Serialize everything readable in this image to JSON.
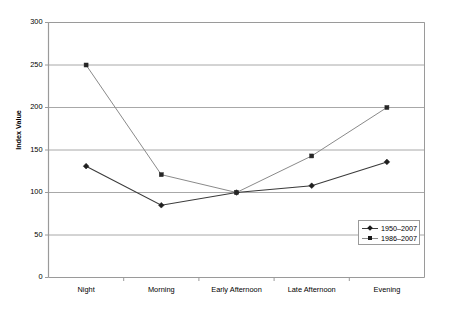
{
  "chart_data": {
    "type": "line",
    "title": "",
    "subtitle": "",
    "xlabel": "",
    "ylabel": "Index Value",
    "categories": [
      "Night",
      "Morning",
      "Early Afternoon",
      "Late Afternoon",
      "Evening"
    ],
    "ylim": [
      0,
      300
    ],
    "ytick_labels": [
      "0",
      "50",
      "100",
      "150",
      "200",
      "250",
      "300"
    ],
    "ytick_values": [
      0,
      50,
      100,
      150,
      200,
      250,
      300
    ],
    "grid": "horizontal",
    "legend_position": "bottom-right-inside",
    "series": [
      {
        "name": "1950–2007",
        "values": [
          131,
          85,
          100,
          108,
          136
        ],
        "marker": "diamond",
        "color": "#3a3a3a",
        "line_width": 1.1
      },
      {
        "name": "1986–2007",
        "values": [
          250,
          121,
          100,
          143,
          200
        ],
        "marker": "square",
        "color": "#8a8a8a",
        "line_width": 1.0
      }
    ]
  },
  "axes": {
    "frame_color": "#9a9a9a",
    "grid_color": "#a8a8a8",
    "tick_color": "#9a9a9a",
    "background": "#ffffff"
  },
  "legend": {
    "entries": [
      "1950–2007",
      "1986–2007"
    ]
  }
}
